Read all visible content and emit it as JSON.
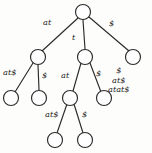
{
  "diagram": {
    "type": "suffix-tree",
    "string": "atat$",
    "colors": {
      "stroke": "#2b2b2b",
      "node_fill": "#ffffff",
      "text": "#1d1d1d",
      "background": "#fdfdfc"
    },
    "nodes": [
      {
        "id": "root",
        "cx": 83,
        "cy": 12,
        "r": 7.5,
        "kind": "root"
      },
      {
        "id": "n_at",
        "cx": 38,
        "cy": 57,
        "r": 7.5,
        "kind": "internal"
      },
      {
        "id": "n_t",
        "cx": 85,
        "cy": 57,
        "r": 7.5,
        "kind": "internal"
      },
      {
        "id": "l_dol",
        "cx": 133,
        "cy": 57,
        "r": 7.5,
        "kind": "leaf"
      },
      {
        "id": "l_at_ats",
        "cx": 11,
        "cy": 98,
        "r": 7.5,
        "kind": "leaf"
      },
      {
        "id": "l_at_dol",
        "cx": 39,
        "cy": 98,
        "r": 7.5,
        "kind": "leaf"
      },
      {
        "id": "n_t_at",
        "cx": 70,
        "cy": 98,
        "r": 7.5,
        "kind": "internal"
      },
      {
        "id": "l_t_dol",
        "cx": 104,
        "cy": 98,
        "r": 7.5,
        "kind": "leaf"
      },
      {
        "id": "l_tat_ats",
        "cx": 55,
        "cy": 140,
        "r": 7.5,
        "kind": "leaf"
      },
      {
        "id": "l_tat_dol",
        "cx": 85,
        "cy": 140,
        "r": 7.5,
        "kind": "leaf"
      }
    ],
    "edges": [
      {
        "id": "e1",
        "from": "root",
        "to": "n_at",
        "x1": 78,
        "y1": 18,
        "x2": 42,
        "y2": 51
      },
      {
        "id": "e2",
        "from": "root",
        "to": "n_t",
        "x1": 83,
        "y1": 20,
        "x2": 85,
        "y2": 49
      },
      {
        "id": "e3",
        "from": "root",
        "to": "l_dol",
        "x1": 89,
        "y1": 17,
        "x2": 129,
        "y2": 51
      },
      {
        "id": "e4",
        "from": "n_at",
        "to": "l_at_ats",
        "x1": 33,
        "y1": 63,
        "x2": 15,
        "y2": 92
      },
      {
        "id": "e5",
        "from": "n_at",
        "to": "l_at_dol",
        "x1": 38,
        "y1": 65,
        "x2": 39,
        "y2": 90
      },
      {
        "id": "e6",
        "from": "n_t",
        "to": "n_t_at",
        "x1": 81,
        "y1": 63,
        "x2": 73,
        "y2": 91
      },
      {
        "id": "e7",
        "from": "n_t",
        "to": "l_t_dol",
        "x1": 90,
        "y1": 63,
        "x2": 101,
        "y2": 92
      },
      {
        "id": "e8",
        "from": "n_t_at",
        "to": "l_tat_ats",
        "x1": 67,
        "y1": 104,
        "x2": 57,
        "y2": 133
      },
      {
        "id": "e9",
        "from": "n_t_at",
        "to": "l_tat_dol",
        "x1": 74,
        "y1": 104,
        "x2": 83,
        "y2": 133
      }
    ],
    "edge_labels": [
      {
        "id": "lbl_root_at",
        "text": "at",
        "x": 43,
        "y": 18
      },
      {
        "id": "lbl_root_t",
        "text": "t",
        "x": 72,
        "y": 33
      },
      {
        "id": "lbl_root_dol",
        "text": "$",
        "x": 109,
        "y": 19
      },
      {
        "id": "lbl_at_ats",
        "text": "at$",
        "x": 3,
        "y": 68
      },
      {
        "id": "lbl_at_dol",
        "text": "$",
        "x": 42,
        "y": 71
      },
      {
        "id": "lbl_t_at",
        "text": "at",
        "x": 61,
        "y": 71
      },
      {
        "id": "lbl_t_dol",
        "text": "$",
        "x": 96,
        "y": 69
      },
      {
        "id": "lbl_tat_ats",
        "text": "at$",
        "x": 45,
        "y": 110
      },
      {
        "id": "lbl_tat_dol",
        "text": "$",
        "x": 82,
        "y": 110
      }
    ],
    "suffix_list": {
      "x": 108,
      "y": 66,
      "items": [
        "$",
        "at$",
        "atat$"
      ]
    }
  }
}
